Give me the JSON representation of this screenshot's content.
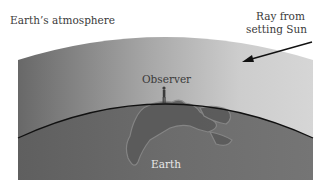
{
  "figure": {
    "labels": {
      "atmosphere": "Earth’s atmosphere",
      "ray_line1": "Ray from",
      "ray_line2": "setting Sun",
      "observer": "Observer",
      "earth": "Earth"
    },
    "colors": {
      "atmosphere_left": "#6e6e6e",
      "atmosphere_right": "#d2d2d2",
      "earth_fill": "#6b6b6b",
      "land_fill": "#595959",
      "land_outline": "#808080",
      "horizon_line": "#111111",
      "text": "#3a3a3a"
    }
  }
}
